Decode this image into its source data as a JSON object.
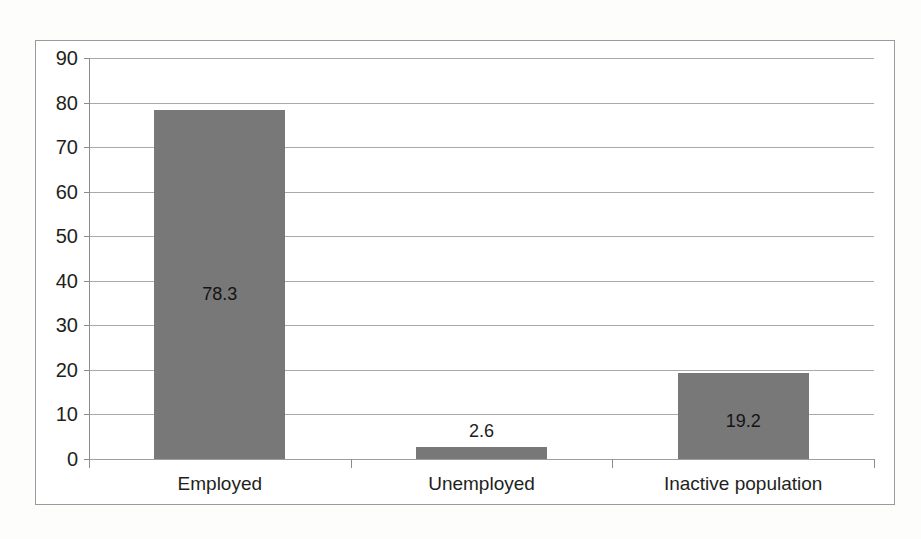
{
  "chart_data": {
    "type": "bar",
    "title": "",
    "subtitle": "",
    "xlabel": "",
    "ylabel": "",
    "categories": [
      "Employed",
      "Unemployed",
      "Inactive population"
    ],
    "values": [
      78.3,
      2.6,
      19.2
    ],
    "data_labels": [
      "78.3",
      "2.6",
      "19.2"
    ],
    "data_label_positions": [
      "inside",
      "outside",
      "inside"
    ],
    "ylim": [
      0,
      90
    ],
    "ytick_step": 10,
    "ytick_labels": [
      "0",
      "10",
      "20",
      "30",
      "40",
      "50",
      "60",
      "70",
      "80",
      "90"
    ],
    "grid": true,
    "grid_orientation": "horizontal",
    "legend": false,
    "legend_position": "none",
    "series": [
      {
        "name": "",
        "values": [
          78.3,
          2.6,
          19.2
        ]
      }
    ],
    "colors": {
      "bar_fill": "#787878",
      "gridline": "#8c8c8c",
      "axis": "#8c8c8c",
      "frame_border": "#9a9a9a",
      "text": "#231f20",
      "background": "#ffffff"
    }
  }
}
